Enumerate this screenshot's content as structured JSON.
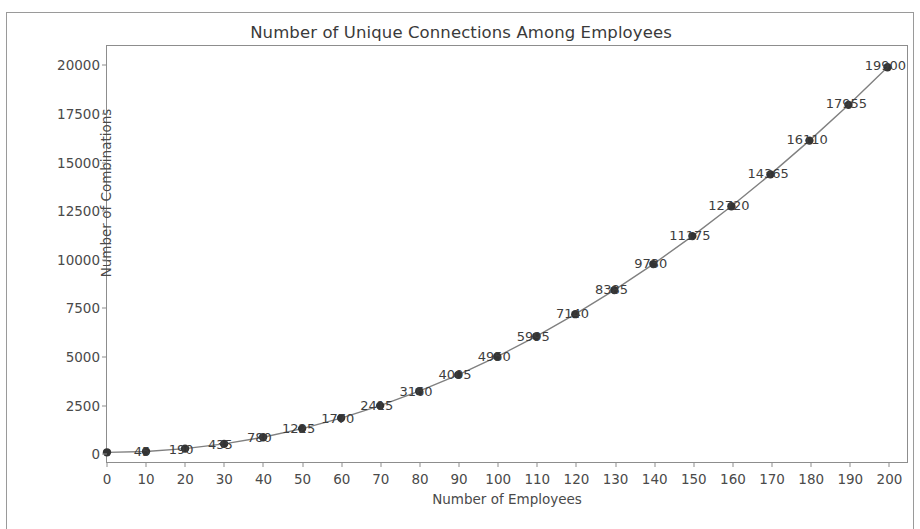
{
  "figure": {
    "border_color": "#9a9a9a",
    "background": "#ffffff"
  },
  "chart_data": {
    "type": "line",
    "title": "Number of Unique Connections Among Employees",
    "xlabel": "Number of Employees",
    "ylabel": "Number of Combinations",
    "x": [
      0,
      10,
      20,
      30,
      40,
      50,
      60,
      70,
      80,
      90,
      100,
      110,
      120,
      130,
      140,
      150,
      160,
      170,
      180,
      190,
      200
    ],
    "values": [
      0,
      45,
      190,
      435,
      780,
      1225,
      1770,
      2415,
      3160,
      4005,
      4950,
      5995,
      7140,
      8385,
      9730,
      11175,
      12720,
      14365,
      16110,
      17955,
      19900
    ],
    "point_labels": [
      "",
      "45",
      "190",
      "435",
      "780",
      "1225",
      "1770",
      "2415",
      "3160",
      "4005",
      "4950",
      "5995",
      "7140",
      "8385",
      "9730",
      "11175",
      "12720",
      "14365",
      "16110",
      "17955",
      "19900"
    ],
    "xlim": [
      0,
      205
    ],
    "ylim": [
      -500,
      21000
    ],
    "xticks": [
      0,
      10,
      20,
      30,
      40,
      50,
      60,
      70,
      80,
      90,
      100,
      110,
      120,
      130,
      140,
      150,
      160,
      170,
      180,
      190,
      200
    ],
    "xticklabels": [
      "0",
      "10",
      "20",
      "30",
      "40",
      "50",
      "60",
      "70",
      "80",
      "90",
      "100",
      "110",
      "120",
      "130",
      "140",
      "150",
      "160",
      "170",
      "180",
      "190",
      "200"
    ],
    "yticks": [
      0,
      2500,
      5000,
      7500,
      10000,
      12500,
      15000,
      17500,
      20000
    ],
    "yticklabels": [
      "0",
      "2500",
      "5000",
      "7500",
      "10000",
      "12500",
      "15000",
      "17500",
      "20000"
    ],
    "grid": false,
    "legend": null,
    "line_color": "#808080",
    "marker_color": "#333333",
    "marker": "circle",
    "marker_size": 6,
    "line_width": 1.4
  }
}
